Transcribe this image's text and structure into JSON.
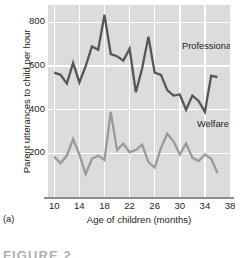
{
  "figure": {
    "panel_caption": "(a)",
    "heading_partial": "FIGURE 2"
  },
  "chart_data": {
    "type": "line",
    "title": "",
    "xlabel": "Age of children (months)",
    "ylabel": "Parent utterances to child per hour",
    "xlim": [
      9,
      38
    ],
    "ylim": [
      0,
      880
    ],
    "xticks": [
      10,
      14,
      18,
      22,
      26,
      30,
      34,
      38
    ],
    "yticks": [
      200,
      400,
      600,
      800
    ],
    "grid": "white gridlines on gray panel, vertical at 10,14,18,22,26,30,34 and horizontal at 200,400,600,800",
    "legend_position": "inline labels beside each line",
    "x": [
      10,
      11,
      12,
      13,
      14,
      15,
      16,
      17,
      18,
      19,
      20,
      21,
      22,
      23,
      24,
      25,
      26,
      27,
      28,
      29,
      30,
      31,
      32,
      33,
      34,
      35,
      36
    ],
    "series": [
      {
        "name": "Professional",
        "color": "#565656",
        "label": "Professional",
        "values": [
          570,
          560,
          520,
          615,
          525,
          600,
          690,
          675,
          835,
          655,
          645,
          625,
          680,
          480,
          590,
          735,
          570,
          560,
          490,
          465,
          470,
          400,
          465,
          440,
          390,
          555,
          550
        ]
      },
      {
        "name": "Welfare",
        "color": "#9a9a9a",
        "label": "Welfare",
        "values": [
          185,
          155,
          190,
          265,
          195,
          105,
          175,
          190,
          170,
          390,
          215,
          245,
          205,
          215,
          240,
          160,
          135,
          225,
          290,
          255,
          195,
          245,
          180,
          165,
          195,
          175,
          110
        ]
      }
    ],
    "colors": {
      "panel_background": "#dcdcdc",
      "gridline": "#ffffff",
      "axis_line": "#8d8d8d",
      "text": "#231f20",
      "professional": "#565656",
      "welfare": "#9a9a9a"
    }
  }
}
